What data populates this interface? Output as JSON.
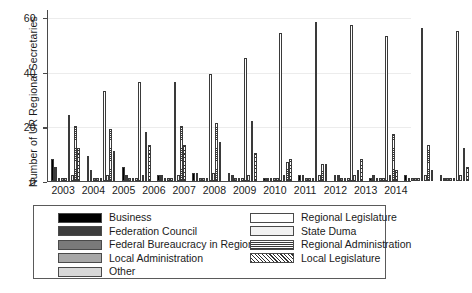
{
  "chart_data": {
    "type": "bar",
    "title": "",
    "xlabel": "",
    "ylabel": "Number of UR Regional Secretaries",
    "ylim": [
      0,
      63
    ],
    "yticks": [
      0,
      20,
      40,
      60
    ],
    "grid": true,
    "legend_position": "bottom",
    "categories": [
      "2003",
      "2004",
      "2005",
      "2006",
      "2007",
      "2008",
      "2009",
      "2010",
      "2011",
      "2012",
      "2013",
      "2014"
    ],
    "series": [
      {
        "name": "Business",
        "pattern": "solid-black",
        "color": "#000000",
        "values": [
          8,
          9,
          5,
          2,
          3,
          3,
          1,
          2,
          2,
          1,
          2,
          2
        ]
      },
      {
        "name": "Federation Council",
        "pattern": "solid-dark-gray",
        "color": "#3d3d3d",
        "values": [
          5,
          4,
          2,
          2,
          3,
          2,
          1,
          2,
          2,
          2,
          1,
          1
        ]
      },
      {
        "name": "Federal Bureaucracy in Region",
        "pattern": "solid-mid-gray",
        "color": "#7a7a7a",
        "values": [
          1,
          1,
          1,
          1,
          1,
          1,
          1,
          1,
          1,
          1,
          1,
          1
        ]
      },
      {
        "name": "Local Administration",
        "pattern": "solid-light-gray",
        "color": "#a8a8a8",
        "values": [
          1,
          1,
          1,
          1,
          1,
          1,
          1,
          1,
          1,
          1,
          1,
          1
        ]
      },
      {
        "name": "Other",
        "pattern": "solid-pale-gray",
        "color": "#d8d8d8",
        "values": [
          1,
          1,
          1,
          1,
          1,
          1,
          1,
          1,
          1,
          1,
          1,
          1
        ]
      },
      {
        "name": "Regional Legislature",
        "pattern": "open-white",
        "color": "#ffffff",
        "values": [
          24,
          33,
          36,
          36,
          39,
          45,
          54,
          58,
          57,
          53,
          56,
          55
        ]
      },
      {
        "name": "State Duma",
        "pattern": "fine-dot",
        "color": "#f2f2f2",
        "values": [
          2,
          2,
          2,
          2,
          3,
          2,
          2,
          2,
          2,
          2,
          2,
          2
        ]
      },
      {
        "name": "Regional Administration",
        "pattern": "horizontal-lines",
        "color": "#ffffff",
        "values": [
          20,
          19,
          18,
          20,
          21,
          22,
          7,
          6,
          4,
          17,
          13,
          12
        ]
      },
      {
        "name": "Local Legislature",
        "pattern": "diagonal-hatch",
        "color": "#ffffff",
        "values": [
          12,
          11,
          13,
          13,
          14,
          10,
          8,
          6,
          8,
          4,
          4,
          5
        ]
      }
    ]
  },
  "legend": {
    "left_column": [
      {
        "label": "Business",
        "swatch": "solid-black"
      },
      {
        "label": "Federation Council",
        "swatch": "solid-dark-gray"
      },
      {
        "label": "Federal Bureaucracy in Region",
        "swatch": "solid-mid-gray"
      },
      {
        "label": "Local Administration",
        "swatch": "solid-light-gray"
      },
      {
        "label": "Other",
        "swatch": "solid-pale-gray"
      }
    ],
    "right_column": [
      {
        "label": "Regional Legislature",
        "swatch": "open-white"
      },
      {
        "label": "State Duma",
        "swatch": "fine-dot"
      },
      {
        "label": "Regional Administration",
        "swatch": "horizontal-lines"
      },
      {
        "label": "Local Legislature",
        "swatch": "diagonal-hatch"
      }
    ]
  }
}
